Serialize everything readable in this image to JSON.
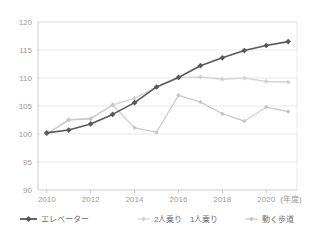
{
  "chart_data": {
    "type": "line",
    "title": "",
    "subtitle": "",
    "xlabel": "(年度)",
    "ylabel": "",
    "x": [
      2010,
      2011,
      2012,
      2013,
      2014,
      2015,
      2016,
      2017,
      2018,
      2019,
      2020,
      2021
    ],
    "xtick_labels": [
      "2010",
      "2012",
      "2014",
      "2016",
      "2018",
      "2020"
    ],
    "xtick_values": [
      2010,
      2012,
      2014,
      2016,
      2018,
      2020
    ],
    "ytick_labels": [
      "90",
      "95",
      "100",
      "105",
      "110",
      "115",
      "120"
    ],
    "ytick_values": [
      90,
      95,
      100,
      105,
      110,
      115,
      120
    ],
    "ylim": [
      90,
      120
    ],
    "xlim": [
      2009.6,
      2021.4
    ],
    "grid": true,
    "legend_position": "bottom",
    "series": [
      {
        "name": "エレベーター",
        "color": "#595959",
        "marker": "diamond",
        "values": [
          100.2,
          100.7,
          101.8,
          103.5,
          105.6,
          108.4,
          110.1,
          112.2,
          113.6,
          114.9,
          115.8,
          116.5
        ]
      },
      {
        "name": "2人乗り",
        "color": "#d2d2d2",
        "marker": "diamond",
        "values": [
          100.0,
          102.6,
          102.8,
          105.2,
          106.4,
          108.4,
          110.1,
          110.2,
          109.8,
          110.0,
          109.4,
          109.3
        ]
      },
      {
        "name": "1人乗り",
        "color": "#ededed",
        "marker": "diamond",
        "values": [
          100.0,
          102.5,
          102.7,
          105.1,
          106.3,
          108.3,
          110.0,
          110.1,
          109.7,
          109.9,
          109.3,
          109.2
        ]
      },
      {
        "name": "動く歩道",
        "color": "#c6c6c6",
        "marker": "diamond",
        "values": [
          100.0,
          102.5,
          102.7,
          105.2,
          101.1,
          100.3,
          106.9,
          105.7,
          103.6,
          102.3,
          104.8,
          104.0
        ]
      }
    ]
  },
  "legend": {
    "items": [
      {
        "label": "エレベーター",
        "color": "#595959"
      },
      {
        "label": "2人乗り",
        "color": "#d2d2d2"
      },
      {
        "label": "1人乗り",
        "color": "#ededed"
      },
      {
        "label": "動く歩道",
        "color": "#c6c6c6"
      }
    ]
  },
  "axis_unit": "(年度)"
}
